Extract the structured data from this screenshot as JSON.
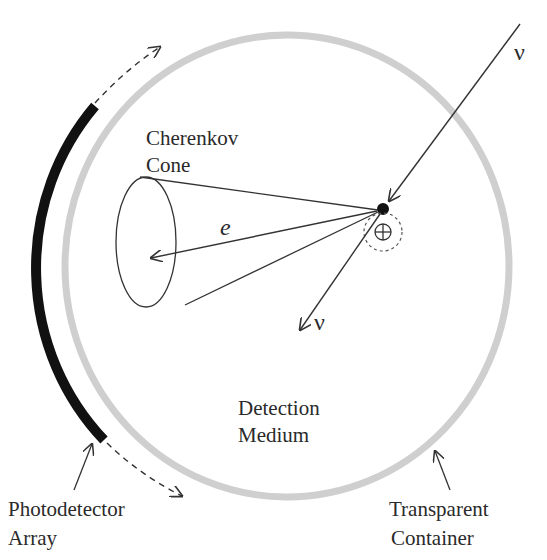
{
  "diagram": {
    "type": "schematic",
    "title": "",
    "labels": {
      "cherenkov_line1": "Cherenkov",
      "cherenkov_line2": "Cone",
      "electron": "e",
      "neutrino_in": "ν",
      "neutrino_out": "ν",
      "nucleus": "⊕",
      "detection_line1": "Detection",
      "detection_line2": "Medium",
      "photodetector_line1": "Photodetector",
      "photodetector_line2": "Array",
      "container_line1": "Transparent",
      "container_line2": "Container"
    },
    "colors": {
      "container": "#c8c8c8",
      "photodetector": "#111111",
      "lines": "#333333",
      "text": "#2a2a2a"
    }
  }
}
